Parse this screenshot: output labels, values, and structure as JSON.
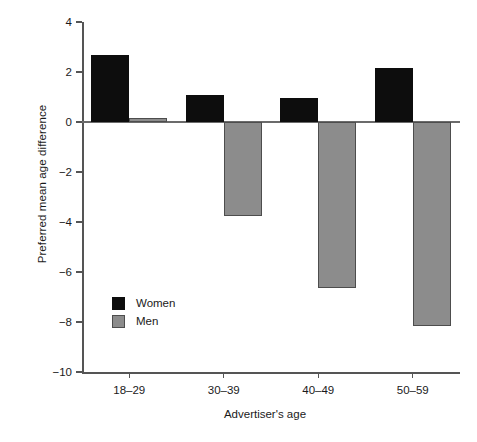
{
  "chart_data": {
    "type": "bar",
    "title": "",
    "subtitle": "",
    "xlabel": "Advertiser's age",
    "ylabel": "Preferred mean age difference",
    "categories": [
      "18–29",
      "30–39",
      "40–49",
      "50–59"
    ],
    "series": [
      {
        "name": "Women",
        "color": "#0d0d0d",
        "values": [
          2.7,
          1.1,
          0.95,
          2.15
        ]
      },
      {
        "name": "Men",
        "color": "#8c8c8c",
        "values": [
          0.15,
          -3.75,
          -6.65,
          -8.15
        ]
      }
    ],
    "ylim": [
      -10,
      4
    ],
    "yticks": [
      4,
      2,
      0,
      -2,
      -4,
      -6,
      -8,
      -10
    ],
    "ytick_labels": [
      "4",
      "2",
      "0",
      "−2",
      "−4",
      "−6",
      "−8",
      "−10"
    ],
    "grid": false,
    "legend_position": "inside-lower-left",
    "zero_reference_line": true
  },
  "legend": {
    "entries": [
      {
        "label": "Women",
        "color": "#0d0d0d"
      },
      {
        "label": "Men",
        "color": "#8c8c8c"
      }
    ]
  },
  "colors": {
    "women": "#0d0d0d",
    "men": "#8c8c8c",
    "axis": "#555555",
    "background": "#ffffff"
  }
}
